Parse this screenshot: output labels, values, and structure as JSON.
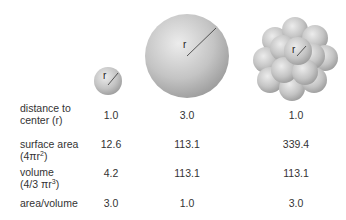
{
  "figure": {
    "sphere_label": "r",
    "columns": [
      {
        "name": "small-sphere"
      },
      {
        "name": "large-sphere"
      },
      {
        "name": "sphere-cluster"
      }
    ],
    "rows": [
      {
        "label_line1": "distance to",
        "label_line2": "center (r)",
        "values": [
          "1.0",
          "3.0",
          "1.0"
        ]
      },
      {
        "label_line1": "surface area",
        "label_line2_pre": "(4πr",
        "label_line2_sup": "2",
        "label_line2_post": ")",
        "values": [
          "12.6",
          "113.1",
          "339.4"
        ]
      },
      {
        "label_line1": "volume",
        "label_line2_pre": "(4/3 πr",
        "label_line2_sup": "3",
        "label_line2_post": ")",
        "values": [
          "4.2",
          "113.1",
          "113.1"
        ]
      },
      {
        "label_line1": "area/volume",
        "values": [
          "3.0",
          "1.0",
          "3.0"
        ]
      }
    ]
  },
  "colors": {
    "sphere_light": "#e6e6e6",
    "sphere_dark": "#9a9a9a",
    "text": "#333333"
  }
}
